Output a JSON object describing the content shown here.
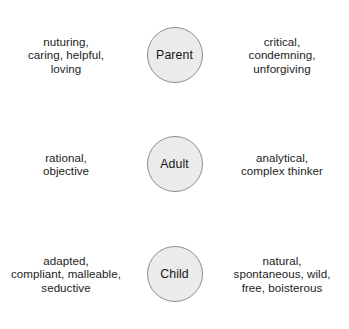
{
  "diagram": {
    "accent_color": "#ebebeb",
    "border_color": "#8d8d8d",
    "text_color": "#1c1c1c",
    "rows": [
      {
        "state": "Parent",
        "left_traits": [
          "nuturing,",
          "caring, helpful,",
          "loving"
        ],
        "right_traits": [
          "critical,",
          "condemning,",
          "unforgiving"
        ]
      },
      {
        "state": "Adult",
        "left_traits": [
          "rational,",
          "objective"
        ],
        "right_traits": [
          "analytical,",
          "complex thinker"
        ]
      },
      {
        "state": "Child",
        "left_traits": [
          "adapted,",
          "compliant, malleable,",
          "seductive"
        ],
        "right_traits": [
          "natural,",
          "spontaneous, wild,",
          "free, boisterous"
        ]
      }
    ]
  }
}
